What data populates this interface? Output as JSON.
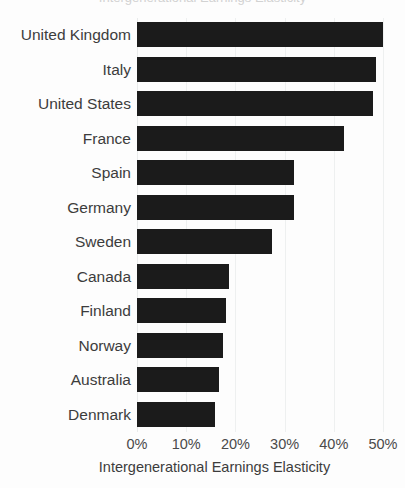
{
  "chart_data": {
    "type": "bar",
    "orientation": "horizontal",
    "title": "",
    "xlabel": "Intergenerational Earnings Elasticity",
    "ylabel": "",
    "xlim": [
      0,
      50
    ],
    "xtick_labels": [
      "0%",
      "10%",
      "20%",
      "30%",
      "40%",
      "50%"
    ],
    "xtick_values": [
      0,
      10,
      20,
      30,
      40,
      50
    ],
    "grid": "vertical",
    "legend": "none",
    "bar_color": "#1b1b1b",
    "background_color": "#fdfdfd",
    "gridline_color": "#eef0f0",
    "categories": [
      "United Kingdom",
      "Italy",
      "United States",
      "France",
      "Spain",
      "Germany",
      "Sweden",
      "Canada",
      "Finland",
      "Norway",
      "Australia",
      "Denmark"
    ],
    "values": [
      50,
      48.5,
      48,
      42,
      32,
      32,
      27.5,
      18.7,
      18,
      17.5,
      16.7,
      15.8
    ],
    "value_labels": [
      "50%",
      "48.5%",
      "48%",
      "42%",
      "32%",
      "32%",
      "27.5%",
      "18.7%",
      "18%",
      "17.5%",
      "16.7%",
      "15.8%"
    ]
  },
  "title_sliver": {
    "text": "Intergenerational Earnings Elasticity"
  }
}
